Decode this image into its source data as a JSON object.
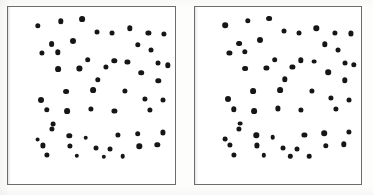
{
  "figure": {
    "background_color": "#fdfdfc",
    "dot_color": "#161616",
    "frame_color": "#6d6d6d",
    "canvas": {
      "width": 373,
      "height": 195
    }
  },
  "panels": [
    {
      "id": "left",
      "name": "left-panel",
      "label": "",
      "frame": {
        "x": 7,
        "y": 6,
        "width": 169,
        "height": 179,
        "border_width": 1.4
      },
      "dot_count": 54,
      "dot_radius_px": 2.6,
      "points": [
        {
          "x": 0.18,
          "y": 0.105,
          "r": 2.7
        },
        {
          "x": 0.318,
          "y": 0.082,
          "r": 2.7
        },
        {
          "x": 0.445,
          "y": 0.068,
          "r": 2.9
        },
        {
          "x": 0.538,
          "y": 0.14,
          "r": 2.5
        },
        {
          "x": 0.625,
          "y": 0.148,
          "r": 2.5
        },
        {
          "x": 0.733,
          "y": 0.122,
          "r": 2.7
        },
        {
          "x": 0.845,
          "y": 0.148,
          "r": 2.6
        },
        {
          "x": 0.94,
          "y": 0.152,
          "r": 2.6
        },
        {
          "x": 0.262,
          "y": 0.21,
          "r": 2.9
        },
        {
          "x": 0.39,
          "y": 0.192,
          "r": 3.0
        },
        {
          "x": 0.205,
          "y": 0.262,
          "r": 2.6
        },
        {
          "x": 0.3,
          "y": 0.258,
          "r": 2.7
        },
        {
          "x": 0.782,
          "y": 0.215,
          "r": 2.7
        },
        {
          "x": 0.862,
          "y": 0.245,
          "r": 2.5
        },
        {
          "x": 0.48,
          "y": 0.3,
          "r": 2.8
        },
        {
          "x": 0.64,
          "y": 0.305,
          "r": 2.7
        },
        {
          "x": 0.718,
          "y": 0.312,
          "r": 2.6
        },
        {
          "x": 0.902,
          "y": 0.32,
          "r": 2.5
        },
        {
          "x": 0.96,
          "y": 0.33,
          "r": 2.7
        },
        {
          "x": 0.3,
          "y": 0.352,
          "r": 2.9
        },
        {
          "x": 0.43,
          "y": 0.348,
          "r": 2.6
        },
        {
          "x": 0.588,
          "y": 0.342,
          "r": 2.6
        },
        {
          "x": 0.802,
          "y": 0.372,
          "r": 2.8
        },
        {
          "x": 0.54,
          "y": 0.412,
          "r": 2.7
        },
        {
          "x": 0.905,
          "y": 0.418,
          "r": 2.7
        },
        {
          "x": 0.348,
          "y": 0.48,
          "r": 2.9
        },
        {
          "x": 0.512,
          "y": 0.472,
          "r": 2.9
        },
        {
          "x": 0.705,
          "y": 0.478,
          "r": 2.6
        },
        {
          "x": 0.2,
          "y": 0.525,
          "r": 3.0
        },
        {
          "x": 0.822,
          "y": 0.52,
          "r": 2.6
        },
        {
          "x": 0.93,
          "y": 0.53,
          "r": 2.5
        },
        {
          "x": 0.232,
          "y": 0.582,
          "r": 2.7
        },
        {
          "x": 0.358,
          "y": 0.592,
          "r": 2.9
        },
        {
          "x": 0.5,
          "y": 0.578,
          "r": 2.6
        },
        {
          "x": 0.64,
          "y": 0.588,
          "r": 2.6
        },
        {
          "x": 0.852,
          "y": 0.582,
          "r": 2.6
        },
        {
          "x": 0.272,
          "y": 0.665,
          "r": 2.4
        },
        {
          "x": 0.262,
          "y": 0.692,
          "r": 2.6
        },
        {
          "x": 0.368,
          "y": 0.73,
          "r": 2.7
        },
        {
          "x": 0.468,
          "y": 0.742,
          "r": 2.3
        },
        {
          "x": 0.66,
          "y": 0.728,
          "r": 2.6
        },
        {
          "x": 0.78,
          "y": 0.718,
          "r": 2.8
        },
        {
          "x": 0.93,
          "y": 0.712,
          "r": 2.6
        },
        {
          "x": 0.178,
          "y": 0.752,
          "r": 2.4
        },
        {
          "x": 0.208,
          "y": 0.785,
          "r": 2.6
        },
        {
          "x": 0.372,
          "y": 0.788,
          "r": 2.6
        },
        {
          "x": 0.528,
          "y": 0.8,
          "r": 2.5
        },
        {
          "x": 0.612,
          "y": 0.806,
          "r": 2.5
        },
        {
          "x": 0.79,
          "y": 0.79,
          "r": 2.7
        },
        {
          "x": 0.898,
          "y": 0.782,
          "r": 2.7
        },
        {
          "x": 0.232,
          "y": 0.84,
          "r": 2.6
        },
        {
          "x": 0.415,
          "y": 0.845,
          "r": 2.2
        },
        {
          "x": 0.575,
          "y": 0.85,
          "r": 2.2
        },
        {
          "x": 0.69,
          "y": 0.848,
          "r": 2.3
        }
      ]
    },
    {
      "id": "right",
      "name": "right-panel",
      "label": "",
      "frame": {
        "x": 194,
        "y": 6,
        "width": 168,
        "height": 179,
        "border_width": 1.4
      },
      "dot_count": 54,
      "dot_radius_px": 2.6,
      "points": [
        {
          "x": 0.182,
          "y": 0.104,
          "r": 2.8
        },
        {
          "x": 0.32,
          "y": 0.08,
          "r": 2.7
        },
        {
          "x": 0.448,
          "y": 0.066,
          "r": 2.9
        },
        {
          "x": 0.54,
          "y": 0.138,
          "r": 2.5
        },
        {
          "x": 0.628,
          "y": 0.146,
          "r": 2.5
        },
        {
          "x": 0.735,
          "y": 0.12,
          "r": 2.7
        },
        {
          "x": 0.848,
          "y": 0.146,
          "r": 2.6
        },
        {
          "x": 0.942,
          "y": 0.15,
          "r": 2.6
        },
        {
          "x": 0.265,
          "y": 0.208,
          "r": 2.9
        },
        {
          "x": 0.392,
          "y": 0.19,
          "r": 3.0
        },
        {
          "x": 0.208,
          "y": 0.26,
          "r": 2.6
        },
        {
          "x": 0.302,
          "y": 0.256,
          "r": 2.7
        },
        {
          "x": 0.785,
          "y": 0.212,
          "r": 2.7
        },
        {
          "x": 0.865,
          "y": 0.242,
          "r": 2.5
        },
        {
          "x": 0.482,
          "y": 0.298,
          "r": 2.8
        },
        {
          "x": 0.642,
          "y": 0.302,
          "r": 2.7
        },
        {
          "x": 0.72,
          "y": 0.31,
          "r": 2.4
        },
        {
          "x": 0.905,
          "y": 0.318,
          "r": 2.5
        },
        {
          "x": 0.962,
          "y": 0.328,
          "r": 2.7
        },
        {
          "x": 0.302,
          "y": 0.35,
          "r": 2.9
        },
        {
          "x": 0.432,
          "y": 0.346,
          "r": 2.6
        },
        {
          "x": 0.59,
          "y": 0.34,
          "r": 2.6
        },
        {
          "x": 0.805,
          "y": 0.37,
          "r": 2.8
        },
        {
          "x": 0.542,
          "y": 0.41,
          "r": 2.7
        },
        {
          "x": 0.908,
          "y": 0.416,
          "r": 2.7
        },
        {
          "x": 0.35,
          "y": 0.478,
          "r": 2.9
        },
        {
          "x": 0.515,
          "y": 0.47,
          "r": 2.9
        },
        {
          "x": 0.708,
          "y": 0.476,
          "r": 2.6
        },
        {
          "x": 0.202,
          "y": 0.522,
          "r": 3.0
        },
        {
          "x": 0.825,
          "y": 0.518,
          "r": 2.6
        },
        {
          "x": 0.932,
          "y": 0.528,
          "r": 2.5
        },
        {
          "x": 0.235,
          "y": 0.58,
          "r": 2.7
        },
        {
          "x": 0.36,
          "y": 0.59,
          "r": 2.9
        },
        {
          "x": 0.502,
          "y": 0.576,
          "r": 2.6
        },
        {
          "x": 0.642,
          "y": 0.586,
          "r": 2.6
        },
        {
          "x": 0.855,
          "y": 0.58,
          "r": 2.6
        },
        {
          "x": 0.275,
          "y": 0.662,
          "r": 2.4
        },
        {
          "x": 0.265,
          "y": 0.69,
          "r": 2.6
        },
        {
          "x": 0.37,
          "y": 0.728,
          "r": 2.7
        },
        {
          "x": 0.47,
          "y": 0.74,
          "r": 2.3
        },
        {
          "x": 0.662,
          "y": 0.726,
          "r": 2.6
        },
        {
          "x": 0.782,
          "y": 0.716,
          "r": 2.8
        },
        {
          "x": 0.932,
          "y": 0.71,
          "r": 2.6
        },
        {
          "x": 0.18,
          "y": 0.75,
          "r": 2.4
        },
        {
          "x": 0.21,
          "y": 0.782,
          "r": 2.6
        },
        {
          "x": 0.375,
          "y": 0.786,
          "r": 2.6
        },
        {
          "x": 0.53,
          "y": 0.798,
          "r": 2.5
        },
        {
          "x": 0.615,
          "y": 0.804,
          "r": 2.5
        },
        {
          "x": 0.792,
          "y": 0.788,
          "r": 2.7
        },
        {
          "x": 0.9,
          "y": 0.78,
          "r": 2.7
        },
        {
          "x": 0.235,
          "y": 0.838,
          "r": 2.6
        },
        {
          "x": 0.418,
          "y": 0.842,
          "r": 2.2
        },
        {
          "x": 0.578,
          "y": 0.848,
          "r": 2.2
        },
        {
          "x": 0.692,
          "y": 0.846,
          "r": 2.3
        }
      ]
    }
  ]
}
